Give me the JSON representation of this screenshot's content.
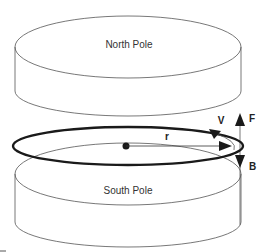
{
  "diagram": {
    "top_magnet": {
      "label": "North Pole"
    },
    "bottom_magnet": {
      "label": "South Pole"
    },
    "ring": {
      "radius_label": "r",
      "velocity_label": "V",
      "force_label": "F",
      "field_label": "B"
    },
    "colors": {
      "line": "#555555",
      "ring": "#1a1a1a",
      "arrow": "#1a1a1a",
      "background": "#ffffff"
    }
  }
}
